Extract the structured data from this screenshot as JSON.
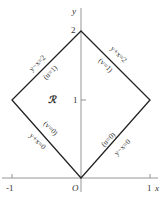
{
  "diagram": {
    "region_label": "ℛ",
    "axes": {
      "x_label": "x",
      "y_label": "y",
      "origin_label": "O",
      "x_ticks": [
        "-1",
        "1"
      ],
      "y_ticks": [
        "1",
        "2"
      ]
    },
    "edges": [
      {
        "position": "upper-left",
        "equation": "y−x=2",
        "param": "(u=1)"
      },
      {
        "position": "upper-right",
        "equation": "y+x=2",
        "param": "(v=1)"
      },
      {
        "position": "lower-left",
        "equation": "y+x=0",
        "param": "(v=0)"
      },
      {
        "position": "lower-right",
        "equation": "y−x=0",
        "param": "(u=0)"
      }
    ],
    "colors": {
      "line": "#222222",
      "axis": "#888888",
      "text": "#333333"
    }
  }
}
